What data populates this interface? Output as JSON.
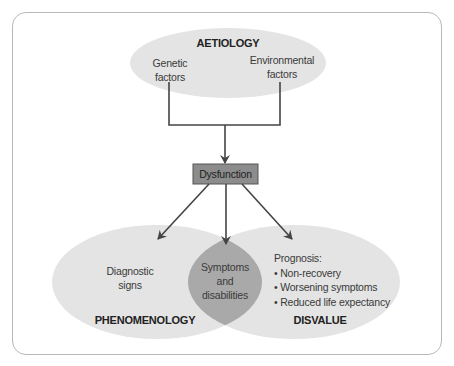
{
  "diagram": {
    "aetiology": {
      "title": "AETIOLOGY",
      "left_factor": [
        "Genetic",
        "factors"
      ],
      "right_factor": [
        "Environmental",
        "factors"
      ]
    },
    "dysfunction": {
      "label": "Dysfunction"
    },
    "phenomenology": {
      "title": "PHENOMENOLOGY",
      "content": [
        "Diagnostic",
        "signs"
      ]
    },
    "overlap": {
      "content": [
        "Symptoms",
        "and",
        "disabilities"
      ]
    },
    "disvalue": {
      "title": "DISVALUE",
      "heading": "Prognosis:",
      "bullets": [
        "• Non-recovery",
        "• Worsening symptoms",
        "• Reduced life expectancy"
      ]
    },
    "colors": {
      "ellipse_fill": "#e4e4e4",
      "overlap_fill": "#a9a9a9",
      "box_fill": "#8c8c8c",
      "line": "#444444"
    }
  }
}
